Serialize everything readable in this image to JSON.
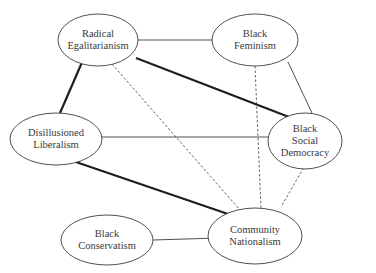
{
  "diagram": {
    "nodes": [
      {
        "id": "radical-egalitarianism",
        "label": "Radical\nEgalitarianism",
        "cx": 98,
        "cy": 40,
        "rx": 40,
        "ry": 26
      },
      {
        "id": "black-feminism",
        "label": "Black\nFeminism",
        "cx": 255,
        "cy": 40,
        "rx": 43,
        "ry": 26
      },
      {
        "id": "disillusioned-liberalism",
        "label": "Disillusioned\nLiberalism",
        "cx": 56,
        "cy": 139,
        "rx": 46,
        "ry": 26
      },
      {
        "id": "black-social-democracy",
        "label": "Black\nSocial\nDemocracy",
        "cx": 305,
        "cy": 141,
        "rx": 37,
        "ry": 28
      },
      {
        "id": "black-conservatism",
        "label": "Black\nConservatism",
        "cx": 107,
        "cy": 240,
        "rx": 46,
        "ry": 25
      },
      {
        "id": "community-nationalism",
        "label": "Community\nNationalism",
        "cx": 255,
        "cy": 236,
        "rx": 47,
        "ry": 28
      }
    ],
    "edges": [
      {
        "from": "radical-egalitarianism",
        "to": "black-feminism",
        "style": "thin",
        "x1": 138,
        "y1": 40,
        "x2": 212,
        "y2": 40
      },
      {
        "from": "radical-egalitarianism",
        "to": "disillusioned-liberalism",
        "style": "thick",
        "x1": 83,
        "y1": 60,
        "x2": 60,
        "y2": 113
      },
      {
        "from": "radical-egalitarianism",
        "to": "black-social-democracy",
        "style": "thick",
        "x1": 136,
        "y1": 58,
        "x2": 289,
        "y2": 117
      },
      {
        "from": "radical-egalitarianism",
        "to": "community-nationalism",
        "style": "dashed",
        "x1": 112,
        "y1": 64,
        "x2": 240,
        "y2": 210
      },
      {
        "from": "black-feminism",
        "to": "black-social-democracy",
        "style": "thin",
        "x1": 288,
        "y1": 62,
        "x2": 312,
        "y2": 113
      },
      {
        "from": "black-feminism",
        "to": "community-nationalism",
        "style": "dashed",
        "x1": 255,
        "y1": 66,
        "x2": 261,
        "y2": 208
      },
      {
        "from": "disillusioned-liberalism",
        "to": "black-social-democracy",
        "style": "thin",
        "x1": 102,
        "y1": 137,
        "x2": 268,
        "y2": 137
      },
      {
        "from": "disillusioned-liberalism",
        "to": "community-nationalism",
        "style": "thick",
        "x1": 73,
        "y1": 161,
        "x2": 228,
        "y2": 214
      },
      {
        "from": "black-social-democracy",
        "to": "community-nationalism",
        "style": "dashed",
        "x1": 308,
        "y1": 160,
        "x2": 281,
        "y2": 207
      },
      {
        "from": "black-conservatism",
        "to": "community-nationalism",
        "style": "thin",
        "x1": 153,
        "y1": 240,
        "x2": 218,
        "y2": 238
      }
    ],
    "colors": {
      "stroke": "#3c3c3c",
      "thick_stroke": "#1e1e1e",
      "background": "#ffffff"
    }
  }
}
